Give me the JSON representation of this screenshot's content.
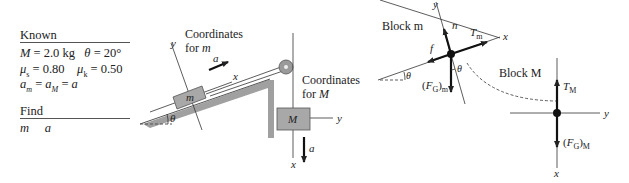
{
  "known": {
    "heading": "Known",
    "line1": "M = 2.0 kg   θ = 20°",
    "line2": "μs = 0.80    μk = 0.50",
    "line3": "am = aM = a"
  },
  "find": {
    "heading": "Find",
    "line1": "m    a"
  },
  "setup_diagram": {
    "coords_m_label_1": "Coordinates",
    "coords_m_label_2": "for m",
    "coords_M_label_1": "Coordinates",
    "coords_M_label_2": "for M",
    "block_m_label": "m",
    "block_M_label": "M",
    "axis_x": "x",
    "axis_y": "y",
    "angle_label": "θ",
    "accel_label": "a"
  },
  "fbd_m": {
    "title": "Block m",
    "normal": "n",
    "tension": "T",
    "tension_sub": "m",
    "friction": "f",
    "gravity": "(F",
    "gravity_sub_G": "G",
    "gravity_close": ")",
    "gravity_sub": "m",
    "axis_x": "x",
    "axis_y": "y",
    "angle": "θ"
  },
  "fbd_M": {
    "title": "Block M",
    "tension": "T",
    "tension_sub": "M",
    "gravity": "(F",
    "gravity_sub_G": "G",
    "gravity_close": ")",
    "gravity_sub": "M",
    "axis_x": "x",
    "axis_y": "y"
  },
  "colors": {
    "block_fill": "#a8a8a8",
    "ramp_fill": "#a0a0a0",
    "pulley_fill": "#9a9a9a",
    "line": "#333333"
  }
}
